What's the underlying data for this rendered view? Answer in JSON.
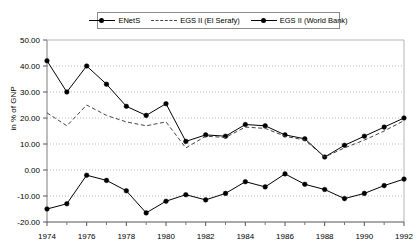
{
  "chart_data": {
    "type": "line",
    "title": "",
    "subtitle": "",
    "xlabel": "",
    "ylabel": "in % of GNP",
    "x": [
      1974,
      1975,
      1976,
      1977,
      1978,
      1979,
      1980,
      1981,
      1982,
      1983,
      1984,
      1985,
      1986,
      1987,
      1988,
      1989,
      1990,
      1991,
      1992
    ],
    "xlim": [
      1974,
      1992
    ],
    "ylim": [
      -20,
      50
    ],
    "ytick_values": [
      50,
      40,
      30,
      20,
      10,
      0,
      -10,
      -20
    ],
    "ytick_labels": [
      "50.00",
      "40.00",
      "30.00",
      "20.00",
      "10.00",
      "0.00",
      "-10.00",
      "-20.00"
    ],
    "xtick_values": [
      1974,
      1976,
      1978,
      1980,
      1982,
      1984,
      1986,
      1988,
      1990,
      1992
    ],
    "xtick_labels": [
      "1974",
      "1976",
      "1978",
      "1980",
      "1982",
      "1984",
      "1986",
      "1988",
      "1990",
      "1992"
    ],
    "xminor_values": [
      1975,
      1977,
      1979,
      1981,
      1983,
      1985,
      1987,
      1989,
      1991
    ],
    "grid": true,
    "grid_axis": "y",
    "legend_position": "top-center",
    "series": [
      {
        "name": "ENetS",
        "style": "solid",
        "marker": "circle",
        "color": "#000000",
        "values": [
          42.0,
          30.0,
          40.0,
          33.0,
          24.5,
          21.0,
          25.5,
          11.0,
          13.5,
          13.0,
          17.5,
          17.0,
          13.5,
          12.0,
          5.0,
          9.5,
          13.0,
          16.5,
          20.0
        ]
      },
      {
        "name": "EGS II (El Serafy)",
        "style": "dashed",
        "marker": "none",
        "color": "#444444",
        "values": [
          22.0,
          17.0,
          25.0,
          21.0,
          18.5,
          17.0,
          18.5,
          8.5,
          13.0,
          12.5,
          16.5,
          16.0,
          13.0,
          11.5,
          5.0,
          8.5,
          11.5,
          15.0,
          19.0
        ]
      },
      {
        "name": "EGS II (World Bank)",
        "style": "solid",
        "marker": "circle",
        "color": "#000000",
        "values": [
          -15.0,
          -13.0,
          -2.0,
          -4.0,
          -8.0,
          -16.5,
          -12.0,
          -9.5,
          -11.5,
          -9.0,
          -4.5,
          -6.5,
          -1.5,
          -5.5,
          -7.5,
          -11.0,
          -9.0,
          -6.0,
          -3.5
        ]
      }
    ]
  },
  "legend": {
    "entries": [
      {
        "label": "ENetS"
      },
      {
        "label": "EGS II (El Serafy)"
      },
      {
        "label": "EGS II (World Bank)"
      }
    ]
  }
}
